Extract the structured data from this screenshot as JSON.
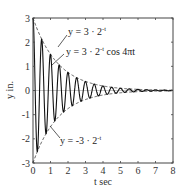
{
  "chart_data": {
    "type": "line",
    "title": "",
    "xlabel": "t sec",
    "ylabel": "y in.",
    "xlim": [
      0,
      8
    ],
    "ylim": [
      -3,
      3
    ],
    "xticks": [
      "0",
      "1",
      "2",
      "3",
      "4",
      "5",
      "6",
      "7",
      "8"
    ],
    "yticks": [
      "3",
      "2",
      "1",
      "0",
      "-1",
      "-2",
      "-3"
    ],
    "grid": false,
    "series": [
      {
        "name": "y = 3 · 2^-t cos 4πt",
        "style": "solid",
        "amplitude": 3,
        "decay_base": 2,
        "frequency_hz": 2
      },
      {
        "name": "y = 3 · 2^-t",
        "style": "dashed"
      },
      {
        "name": "y = -3 · 2^-t",
        "style": "dashed"
      }
    ],
    "annotations": [
      {
        "text": "y = 3 · 2",
        "sup": "-t",
        "tail": ""
      },
      {
        "text": "y = 3 · 2",
        "sup": "-t",
        "tail": " cos 4πt"
      },
      {
        "text": "y = -3 · 2",
        "sup": "-t",
        "tail": ""
      }
    ]
  }
}
